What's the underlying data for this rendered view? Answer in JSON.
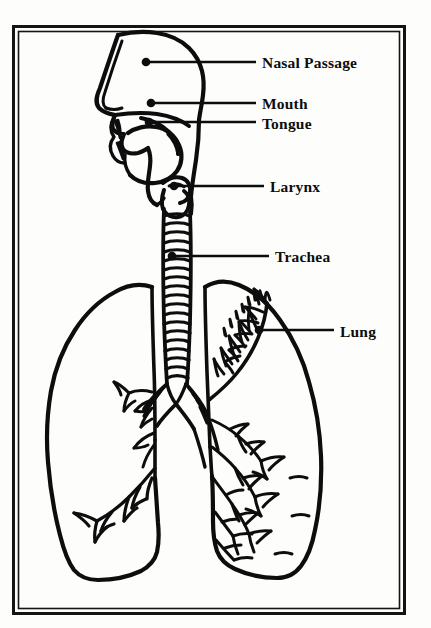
{
  "diagram": {
    "style": "line-art anatomical illustration",
    "background_color": "#fdfdfc",
    "ink_color": "#0d0d0d",
    "frame": {
      "name": "double-line-border",
      "outer": {
        "x": 13,
        "y": 26,
        "width": 392,
        "height": 588
      },
      "inner_offset": 5
    },
    "labels": [
      {
        "id": "nasal-passage",
        "text": "Nasal Passage",
        "text_x": 262,
        "text_y": 65,
        "leader": {
          "x1": 146,
          "y1": 62,
          "x2": 256,
          "y2": 62
        },
        "dot": {
          "x": 146,
          "y": 62
        }
      },
      {
        "id": "mouth",
        "text": "Mouth",
        "text_x": 262,
        "text_y": 107,
        "leader": {
          "x1": 151,
          "y1": 103,
          "x2": 256,
          "y2": 103
        },
        "dot": {
          "x": 151,
          "y": 103
        }
      },
      {
        "id": "tongue",
        "text": "Tongue",
        "text_x": 262,
        "text_y": 128,
        "leader": {
          "x1": 149,
          "y1": 122,
          "x2": 256,
          "y2": 122
        },
        "dot": {
          "x": 149,
          "y": 122
        }
      },
      {
        "id": "larynx",
        "text": "Larynx",
        "text_x": 270,
        "text_y": 190,
        "leader": {
          "x1": 174,
          "y1": 186,
          "x2": 264,
          "y2": 186
        },
        "dot": {
          "x": 174,
          "y": 186
        }
      },
      {
        "id": "trachea",
        "text": "Trachea",
        "text_x": 275,
        "text_y": 260,
        "leader": {
          "x1": 172,
          "y1": 256,
          "x2": 269,
          "y2": 256
        },
        "dot": {
          "x": 172,
          "y": 256
        }
      },
      {
        "id": "lung",
        "text": "Lung",
        "text_x": 340,
        "text_y": 336,
        "leader": {
          "x1": 259,
          "y1": 330,
          "x2": 334,
          "y2": 330
        },
        "dot": {
          "x": 259,
          "y": 330
        }
      }
    ],
    "anatomy": {
      "head_profile": "sagittal section of head showing nasal cavity, oral cavity, tongue, palate and pharynx",
      "trachea": {
        "ring_count": 19,
        "top_y": 200,
        "bottom_y": 385,
        "center_x": 176,
        "width": 26
      },
      "bronchi": {
        "bifurcation_y": 385,
        "left_ring_count": 7,
        "right_ring_count": 7
      },
      "left_lung": {
        "label": "left lung (viewer left)",
        "detail": "sparse bronchial branching near hilum and lower lobe"
      },
      "right_lung": {
        "label": "right lung (viewer right)",
        "detail": "dense bronchial tree filling the lobe"
      }
    }
  }
}
